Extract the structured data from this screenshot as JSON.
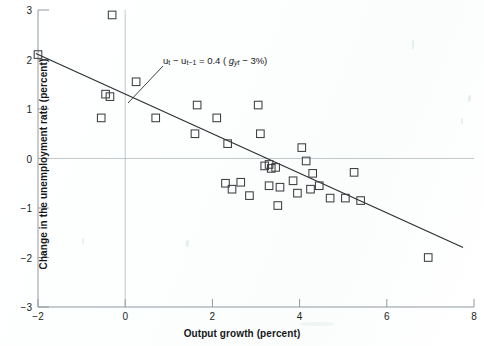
{
  "figure": {
    "background_color": "#ffffff",
    "marker_color": "#3c3f42",
    "line_color": "#2b2e30",
    "axis_color": "#8f9aa0",
    "text_color": "#15181a"
  },
  "annotation": {
    "u_t": "u",
    "sub_t": "t",
    "minus": "−",
    "u_t_minus_1": "u",
    "sub_t_minus_1": "t − 1",
    "equals": "= 0.4 (",
    "g_symbol": "g",
    "g_sub": "yt",
    "tail": " − 3%)",
    "full_text": "u_t − u_{t−1} = 0.4 (g_yt − 3%)",
    "leader_from": [
      163,
      66
    ],
    "leader_to": [
      128,
      103
    ]
  },
  "chart_data": {
    "type": "scatter",
    "title": "",
    "xlabel": "Output growth (percent)",
    "ylabel": "Change in the unemployment rate (percent)",
    "xlim": [
      -2,
      8
    ],
    "ylim": [
      -3,
      3
    ],
    "xticks": [
      -2,
      0,
      2,
      4,
      6,
      8
    ],
    "xtick_labels": [
      "−2",
      "0",
      "2",
      "4",
      "6",
      "8"
    ],
    "yticks": [
      -3,
      -2,
      -1,
      0,
      1,
      2,
      3
    ],
    "ytick_labels": [
      "−3",
      "−2",
      "−1",
      "0",
      "1",
      "2",
      "3"
    ],
    "grid": false,
    "zero_lines": {
      "horizontal_y": 0,
      "vertical_x": 0
    },
    "legend": null,
    "marker_style": "open-square",
    "series": [
      {
        "name": "Annual observations",
        "points": [
          [
            -2.0,
            2.1
          ],
          [
            -0.3,
            2.9
          ],
          [
            -0.45,
            1.3
          ],
          [
            -0.35,
            1.25
          ],
          [
            -0.55,
            0.82
          ],
          [
            0.25,
            1.55
          ],
          [
            0.7,
            0.82
          ],
          [
            1.65,
            1.08
          ],
          [
            1.6,
            0.5
          ],
          [
            2.1,
            0.82
          ],
          [
            2.35,
            0.3
          ],
          [
            2.3,
            -0.5
          ],
          [
            2.45,
            -0.62
          ],
          [
            2.65,
            -0.48
          ],
          [
            2.85,
            -0.75
          ],
          [
            3.05,
            1.08
          ],
          [
            3.1,
            0.5
          ],
          [
            3.2,
            -0.15
          ],
          [
            3.3,
            -0.12
          ],
          [
            3.35,
            -0.2
          ],
          [
            3.45,
            -0.18
          ],
          [
            3.3,
            -0.55
          ],
          [
            3.55,
            -0.58
          ],
          [
            3.5,
            -0.95
          ],
          [
            3.85,
            -0.45
          ],
          [
            3.95,
            -0.7
          ],
          [
            4.05,
            0.22
          ],
          [
            4.15,
            -0.05
          ],
          [
            4.3,
            -0.3
          ],
          [
            4.25,
            -0.62
          ],
          [
            4.45,
            -0.55
          ],
          [
            4.7,
            -0.8
          ],
          [
            5.05,
            -0.8
          ],
          [
            5.25,
            -0.28
          ],
          [
            5.4,
            -0.85
          ],
          [
            6.95,
            -2.0
          ]
        ]
      }
    ],
    "fit_line": {
      "name": "Okun's law regression line",
      "x_start": -2.05,
      "y_start": 2.12,
      "x_end": 7.75,
      "y_end": -1.8,
      "slope": -0.4,
      "intercept": 1.2,
      "equation": "u_t − u_{t−1} = 0.4 (g_yt − 3%)"
    }
  }
}
